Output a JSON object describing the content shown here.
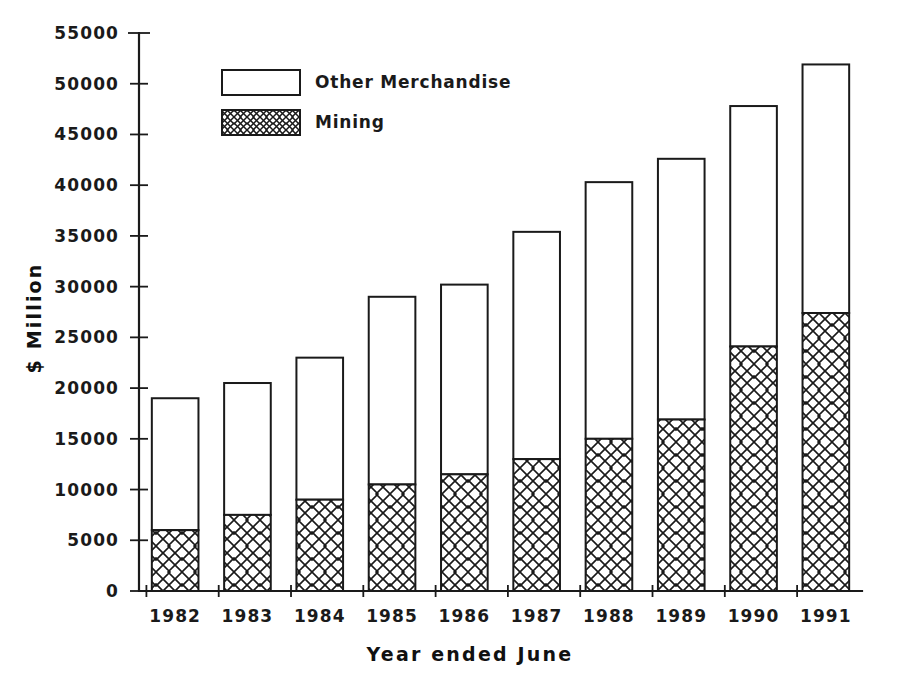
{
  "chart_data": {
    "type": "bar",
    "subtype": "stacked-bar",
    "title": "",
    "subtitle": "",
    "xlabel": "Year ended June",
    "ylabel": "$ Million",
    "categories": [
      "1982",
      "1983",
      "1984",
      "1985",
      "1986",
      "1987",
      "1988",
      "1989",
      "1990",
      "1991"
    ],
    "series": [
      {
        "name": "Mining",
        "values": [
          6000,
          7500,
          9000,
          10500,
          11500,
          13000,
          15000,
          16900,
          24100,
          27400
        ],
        "fill": "cross-hatch",
        "color": "#ffffff"
      },
      {
        "name": "Other Merchandise",
        "values": [
          13000,
          13000,
          14000,
          18500,
          18700,
          22400,
          25300,
          25700,
          23700,
          24500
        ],
        "fill": "solid-white",
        "color": "#ffffff"
      }
    ],
    "totals": [
      19000,
      20500,
      23000,
      29000,
      30200,
      35400,
      40300,
      42600,
      47800,
      51900
    ],
    "ylim": [
      0,
      55000
    ],
    "ytick_step": 5000,
    "yticks": [
      "0",
      "5000",
      "10000",
      "15000",
      "20000",
      "25000",
      "30000",
      "35000",
      "40000",
      "45000",
      "50000",
      "55000"
    ],
    "grid": false,
    "legend_position": "top-left-inside",
    "legend": [
      {
        "label": "Other Merchandise",
        "swatch": "empty-box"
      },
      {
        "label": "Mining",
        "swatch": "hatched-box"
      }
    ],
    "axis_color": "#1a1a1a",
    "background": "#ffffff"
  }
}
